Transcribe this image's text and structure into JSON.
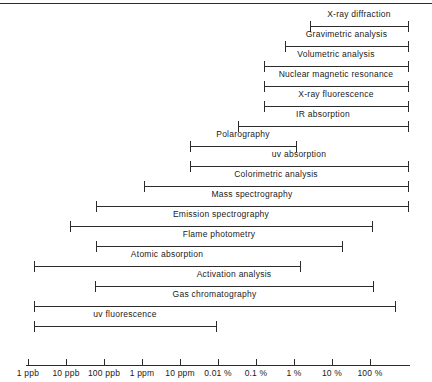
{
  "chart_data": {
    "type": "bar",
    "chart_kind": "range-bar",
    "title": "",
    "xlabel": "",
    "ylabel": "",
    "grid": false,
    "legend": false,
    "axis_scale": "log",
    "axis_ticks": [
      {
        "label": "1 ppb",
        "index": 0,
        "x_px": 28
      },
      {
        "label": "10 ppb",
        "index": 1,
        "x_px": 66
      },
      {
        "label": "100 ppb",
        "index": 2,
        "x_px": 104
      },
      {
        "label": "1 ppm",
        "index": 3,
        "x_px": 142
      },
      {
        "label": "10 ppm",
        "index": 4,
        "x_px": 180
      },
      {
        "label": "0.01 %",
        "index": 5,
        "x_px": 218
      },
      {
        "label": "0.1 %",
        "index": 6,
        "x_px": 256
      },
      {
        "label": "1 %",
        "index": 7,
        "x_px": 294
      },
      {
        "label": "10 %",
        "index": 8,
        "x_px": 332
      },
      {
        "label": "100 %",
        "index": 9,
        "x_px": 370
      }
    ],
    "axis_px_start": 28,
    "axis_px_end": 408,
    "categories": [
      "X-ray diffraction",
      "Gravimetric analysis",
      "Volumetric analysis",
      "Nuclear magnetic resonance",
      "X-ray fluorescence",
      "IR absorption",
      "Polarography",
      "uv absorption",
      "Colorimetric analysis",
      "Mass spectrography",
      "Emission spectrography",
      "Flame photometry",
      "Atomic absorption",
      "Activation analysis",
      "Gas chromatography",
      "uv fluorescence"
    ],
    "bars": [
      {
        "label": "X-ray diffraction",
        "start_px": 310,
        "end_px": 408,
        "start": "0.5 %",
        "end": "100 %"
      },
      {
        "label": "Gravimetric analysis",
        "start_px": 285,
        "end_px": 408,
        "start": "0.05 %",
        "end": "100 %"
      },
      {
        "label": "Volumetric analysis",
        "start_px": 264,
        "end_px": 408,
        "start": "0.01 %",
        "end": "100 %"
      },
      {
        "label": "Nuclear magnetic resonance",
        "start_px": 264,
        "end_px": 408,
        "start": "0.01 %",
        "end": "100 %"
      },
      {
        "label": "X-ray fluorescence",
        "start_px": 264,
        "end_px": 408,
        "start": "0.01 %",
        "end": "100 %"
      },
      {
        "label": "IR absorption",
        "start_px": 238,
        "end_px": 408,
        "start": "50 ppm",
        "end": "100 %"
      },
      {
        "label": "Polarography",
        "start_px": 190,
        "end_px": 296,
        "start": "1 ppm",
        "end": "1 %"
      },
      {
        "label": "uv absorption",
        "start_px": 190,
        "end_px": 408,
        "start": "1 ppm",
        "end": "100 %"
      },
      {
        "label": "Colorimetric analysis",
        "start_px": 144,
        "end_px": 408,
        "start": "100 ppb",
        "end": "100 %"
      },
      {
        "label": "Mass spectrography",
        "start_px": 96,
        "end_px": 408,
        "start": "10 ppb",
        "end": "100 %"
      },
      {
        "label": "Emission spectrography",
        "start_px": 70,
        "end_px": 372,
        "start": "5 ppb",
        "end": "100 %"
      },
      {
        "label": "Flame photometry",
        "start_px": 96,
        "end_px": 342,
        "start": "10 ppb",
        "end": "20 %"
      },
      {
        "label": "Atomic absorption",
        "start_px": 34,
        "end_px": 300,
        "start": "1 ppb",
        "end": "1 %"
      },
      {
        "label": "Activation analysis",
        "start_px": 95,
        "end_px": 373,
        "start": "10 ppb",
        "end": "100 %"
      },
      {
        "label": "Gas chromatography",
        "start_px": 34,
        "end_px": 395,
        "start": "1 ppb",
        "end": "50 %"
      },
      {
        "label": "uv fluorescence",
        "start_px": 34,
        "end_px": 216,
        "start": "1 ppb",
        "end": "50 ppm"
      }
    ],
    "colors": {
      "line": "#2b2b2b",
      "text": "#1a1a1a",
      "background": "#ffffff"
    }
  }
}
